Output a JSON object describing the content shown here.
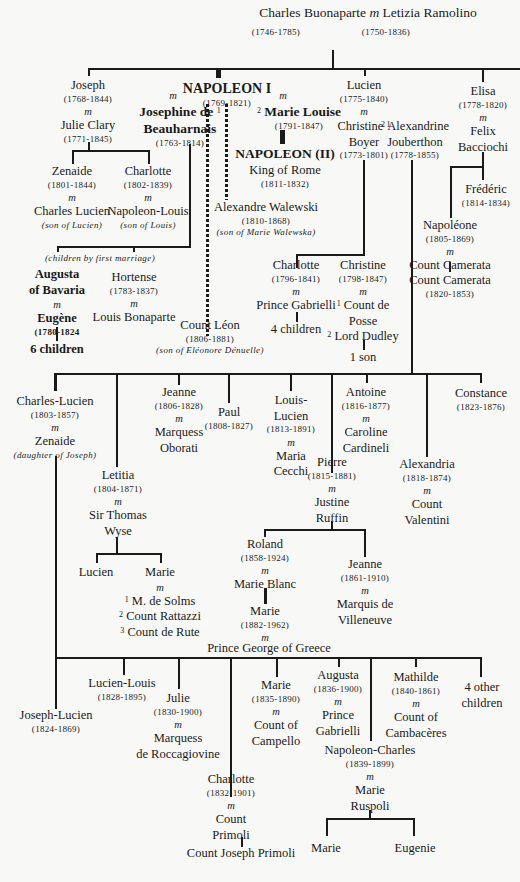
{
  "diagram": {
    "root": {
      "husband": "Charles Buonaparte",
      "husband_dates": "(1746-1785)",
      "marriage": "m",
      "wife": "Letizia Ramolino",
      "wife_dates": "(1750-1836)"
    },
    "marriage_mark": "m",
    "joseph": {
      "name": "Joseph",
      "dates": "(1768-1844)",
      "spouse": "Julie Clary",
      "spouse_dates": "(1771-1845)"
    },
    "joseph_children": [
      {
        "name": "Zenaide",
        "dates": "(1801-1844)",
        "spouse": "Charles Lucien",
        "note": "(son of Lucien)"
      },
      {
        "name": "Charlotte",
        "dates": "(1802-1839)",
        "spouse": "Napoleon-Louis",
        "note": "(son of Louis)"
      }
    ],
    "napoleon": {
      "name": "NAPOLEON I",
      "dates": "(1769-1821)"
    },
    "josephine": {
      "num": "1",
      "name_line1": "Josephine de",
      "name_line2": "Beauharnais",
      "dates": "(1763-1814)"
    },
    "marie_louise": {
      "num": "2",
      "name": "Marie Louise",
      "dates": "(1791-1847)"
    },
    "napoleon_ii": {
      "name": "NAPOLEON (II)",
      "title": "King of Rome",
      "dates": "(1811-1832)"
    },
    "walewski": {
      "name": "Alexandre Walewski",
      "dates": "(1810-1868)",
      "note": "(son of Marie Walewska)"
    },
    "leon": {
      "name": "Count Léon",
      "dates": "(1806-1881)",
      "note": "(son of Eléonore Dénuelle)"
    },
    "josephine_children_note": "(children by first marriage)",
    "eugene": {
      "spouse_line1": "Augusta",
      "spouse_line2": "of Bavaria",
      "name": "Eugène",
      "dates": "(1780-1824",
      "children": "6 children"
    },
    "hortense": {
      "name": "Hortense",
      "dates": "(1783-1837)",
      "spouse": "Louis Bonaparte"
    },
    "lucien": {
      "name": "Lucien",
      "dates": "(1775-1840)",
      "spouse1": {
        "num": "1",
        "name_line1": "Christine",
        "name_line2": "Boyer",
        "dates": "(1773-1801)"
      },
      "spouse2": {
        "num": "2",
        "name_line1": "Alexandrine",
        "name_line2": "Jouberthon",
        "dates": "(1778-1855)"
      }
    },
    "lucien_first_children": [
      {
        "name": "Charlotte",
        "dates": "(1796-1841)",
        "spouse": "Prince Gabrielli",
        "children": "4 children"
      },
      {
        "name": "Christine",
        "dates": "(1798-1847)",
        "spouse1_num": "1",
        "spouse1_line1": "Count de",
        "spouse1_line2": "Posse",
        "spouse2_num": "2",
        "spouse2": "Lord Dudley",
        "children": "1 son"
      }
    ],
    "elisa": {
      "name": "Elisa",
      "dates": "(1778-1820)",
      "spouse_line1": "Felix",
      "spouse_line2": "Bacciochi"
    },
    "elisa_children": [
      {
        "name": "Frédéric",
        "dates": "(1814-1834)"
      },
      {
        "name": "Napoléone",
        "dates": "(1805-1869)",
        "spouse": "Count Camerata",
        "child": "Count Camerata",
        "child_dates": "(1820-1853)"
      }
    ],
    "lucien_second_children": [
      {
        "name": "Charles-Lucien",
        "dates": "(1803-1857)",
        "spouse": "Zenaide",
        "note": "(daughter of Joseph)"
      },
      {
        "name": "Letitia",
        "dates": "(1804-1871)",
        "spouse_line1": "Sir Thomas",
        "spouse_line2": "Wyse"
      },
      {
        "name": "Jeanne",
        "dates": "(1806-1828)",
        "spouse_line1": "Marquess",
        "spouse_line2": "Oborati"
      },
      {
        "name": "Paul",
        "dates": "(1808-1827)"
      },
      {
        "name_line1": "Louis-",
        "name_line2": "Lucien",
        "dates": "(1813-1891)",
        "spouse_line1": "Maria",
        "spouse_line2": "Cecchi"
      },
      {
        "name": "Pierre",
        "dates": "(1815-1881)",
        "spouse_line1": "Justine",
        "spouse_line2": "Ruffin"
      },
      {
        "name": "Antoine",
        "dates": "(1816-1877)",
        "spouse_line1": "Caroline",
        "spouse_line2": "Cardineli"
      },
      {
        "name": "Alexandria",
        "dates": "(1818-1874)",
        "spouse_line1": "Count",
        "spouse_line2": "Valentini"
      },
      {
        "name": "Constance",
        "dates": "(1823-1876)"
      }
    ],
    "letitia_children": [
      {
        "name": "Lucien"
      },
      {
        "name": "Marie",
        "spouse1": "M. de Solms",
        "spouse2": "Count Rattazzi",
        "spouse3": "Count de Rute",
        "n1": "1",
        "n2": "2",
        "n3": "3"
      }
    ],
    "pierre_children": [
      {
        "name": "Roland",
        "dates": "(1858-1924)",
        "spouse": "Marie Blanc",
        "child": "Marie",
        "child_dates": "(1882-1962)",
        "child_spouse": "Prince George of Greece"
      },
      {
        "name": "Jeanne",
        "dates": "(1861-1910)",
        "spouse_line1": "Marquis de",
        "spouse_line2": "Villeneuve"
      }
    ],
    "charles_lucien_children": [
      {
        "name": "Joseph-Lucien",
        "dates": "(1824-1869)"
      },
      {
        "name": "Lucien-Louis",
        "dates": "(1828-1895)"
      },
      {
        "name": "Julie",
        "dates": "(1830-1900)",
        "spouse_line1": "Marquess",
        "spouse_line2": "de Roccagiovine"
      },
      {
        "name": "Charlotte",
        "dates": "(1832-1901)",
        "spouse_line1": "Count",
        "spouse_line2": "Primoli",
        "child": "Count Joseph Primoli"
      },
      {
        "name": "Marie",
        "dates": "(1835-1890)",
        "spouse_line1": "Count of",
        "spouse_line2": "Campello"
      },
      {
        "name": "Augusta",
        "dates": "(1836-1900)",
        "spouse_line1": "Prince",
        "spouse_line2": "Gabrielli"
      },
      {
        "name": "Napoleon-Charles",
        "dates": "(1839-1899)",
        "spouse_line1": "Marie",
        "spouse_line2": "Ruspoli"
      },
      {
        "name": "Mathilde",
        "dates": "(1840-1861)",
        "spouse_line1": "Count of",
        "spouse_line2": "Cambacères"
      },
      {
        "name_line1": "4 other",
        "name_line2": "children"
      }
    ],
    "napoleon_charles_children": [
      {
        "name": "Marie"
      },
      {
        "name": "Eugenie"
      }
    ]
  }
}
